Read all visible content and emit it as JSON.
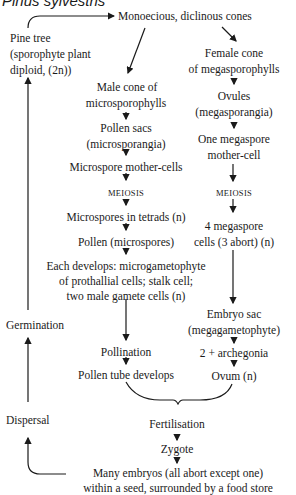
{
  "title": "Pinus sylvestris",
  "nodes": {
    "cones": "Monoecious, diclinous cones",
    "pine_tree_1": "Pine tree",
    "pine_tree_2": "(sporophyte plant",
    "pine_tree_3": "diploid, (2n))",
    "male_cone_1": "Male cone of",
    "male_cone_2": "microsporophylls",
    "pollen_sacs_1": "Pollen sacs",
    "pollen_sacs_2": "(microsporangia)",
    "microspore_mc": "Microspore mother-cells",
    "meiosis_left": "MEIOSIS",
    "tetrads": "Microspores in tetrads (n)",
    "pollen": "Pollen (microspores)",
    "develops_1": "Each develops: microgametophyte",
    "develops_2": "of prothallial cells; stalk cell;",
    "develops_3": "two male gamete cells (n)",
    "pollination": "Pollination",
    "pollen_tube": "Pollen tube develops",
    "female_cone_1": "Female cone",
    "female_cone_2": "of megasporophylls",
    "ovules_1": "Ovules",
    "ovules_2": "(megasporangia)",
    "megaspore_mc_1": "One megaspore",
    "megaspore_mc_2": "mother-cell",
    "meiosis_right": "MEIOSIS",
    "megaspore_cells_1": "4 megaspore",
    "megaspore_cells_2": "cells (3 abort) (n)",
    "embryo_sac_1": "Embryo sac",
    "embryo_sac_2": "(megagametophyte)",
    "archegonia": "2 + archegonia",
    "ovum": "Ovum (n)",
    "fertilisation": "Fertilisation",
    "zygote": "Zygote",
    "embryos_1": "Many embryos (all abort except one)",
    "embryos_2": "within a seed, surrounded by a food store",
    "germination": "Germination",
    "dispersal": "Dispersal"
  }
}
